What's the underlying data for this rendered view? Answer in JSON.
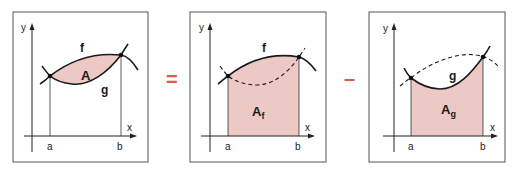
{
  "colors": {
    "fill": "#ecc9c4",
    "stroke": "#1a1a1a",
    "operator": "#e05a4a",
    "frame": "#555555"
  },
  "operators": {
    "equals": "=",
    "minus": "–"
  },
  "panels": [
    {
      "id": "total-area",
      "axis_x": "x",
      "axis_y": "y",
      "bound_a": "a",
      "bound_b": "b",
      "curve_upper": "f",
      "curve_lower": "g",
      "region_label": "A",
      "region_subscript": ""
    },
    {
      "id": "area-under-f",
      "axis_x": "x",
      "axis_y": "y",
      "bound_a": "a",
      "bound_b": "b",
      "curve_label": "f",
      "region_label": "A",
      "region_subscript": "f"
    },
    {
      "id": "area-under-g",
      "axis_x": "x",
      "axis_y": "y",
      "bound_a": "a",
      "bound_b": "b",
      "curve_label": "g",
      "region_label": "A",
      "region_subscript": "g"
    }
  ]
}
